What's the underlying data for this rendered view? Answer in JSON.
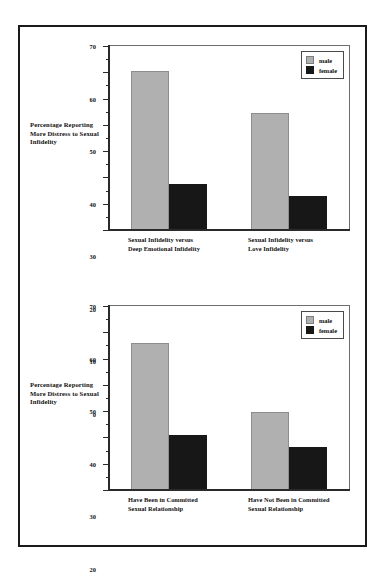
{
  "figure": {
    "axis_caption": "Percentage\nReporting\nMore Distress to\nSexual Infidelity",
    "legend": {
      "male_label": "male",
      "female_label": "female"
    },
    "colors": {
      "male": "#b0b0b0",
      "female": "#171717",
      "frame": "#1a1a1a",
      "axis": "#2a2a2a",
      "background": "#ffffff"
    }
  },
  "chart_data": [
    {
      "type": "bar",
      "title": "",
      "xlabel": "",
      "ylabel": "Percentage Reporting More Distress to Sexual Infidelity",
      "ylim": [
        0,
        70
      ],
      "yticks": [
        0,
        10,
        20,
        30,
        40,
        50,
        60,
        70
      ],
      "ytick_labels": [
        "0",
        "10",
        "20",
        "30",
        "40",
        "50",
        "60",
        "70"
      ],
      "minor_tick_step": 5,
      "grid": false,
      "legend_position": "top-right",
      "categories": [
        "Sexual Infidelity versus\nDeep Emotional Infidelity",
        "Sexual Infidelity versus\nLove Infidelity"
      ],
      "series": [
        {
          "name": "male",
          "values": [
            60.5,
            44.5
          ]
        },
        {
          "name": "female",
          "values": [
            17.5,
            13.0
          ]
        }
      ]
    },
    {
      "type": "bar",
      "title": "",
      "xlabel": "",
      "ylabel": "Percentage Reporting More Distress to Sexual Infidelity",
      "ylim": [
        0,
        70
      ],
      "yticks": [
        0,
        10,
        20,
        30,
        40,
        50,
        60,
        70
      ],
      "ytick_labels": [
        "0",
        "10",
        "20",
        "30",
        "40",
        "50",
        "60",
        "70"
      ],
      "minor_tick_step": 5,
      "grid": false,
      "legend_position": "top-right",
      "categories": [
        "Have Been in Committed\nSexual Relationship",
        "Have Not Been in Committed\nSexual Relationship"
      ],
      "series": [
        {
          "name": "male",
          "values": [
            55.8,
            29.6
          ]
        },
        {
          "name": "female",
          "values": [
            21.0,
            16.5
          ]
        }
      ]
    }
  ]
}
